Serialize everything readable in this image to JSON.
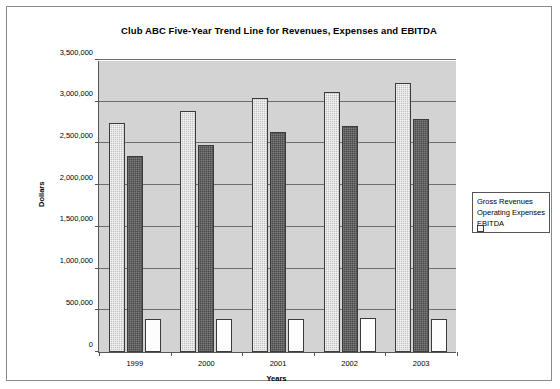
{
  "chart_data": {
    "type": "bar",
    "title": "Club ABC Five-Year Trend Line for Revenues, Expenses and EBITDA",
    "xlabel": "Years",
    "ylabel": "Dollars",
    "categories": [
      "1999",
      "2000",
      "2001",
      "2002",
      "2003"
    ],
    "ylim": [
      0,
      3500000
    ],
    "ytick_labels": [
      "0",
      "500,000",
      "1,000,000",
      "1,500,000",
      "2,000,000",
      "2,500,000",
      "3,000,000",
      "3,500,000"
    ],
    "ytick_values": [
      0,
      500000,
      1000000,
      1500000,
      2000000,
      2500000,
      3000000,
      3500000
    ],
    "grid": true,
    "legend_position": "right",
    "series": [
      {
        "name": "Gross Revenues",
        "color": "#c2c2c2",
        "values": [
          2740000,
          2890000,
          3050000,
          3120000,
          3220000
        ]
      },
      {
        "name": "Operating Expenses",
        "color": "#4a4a4a",
        "values": [
          2350000,
          2480000,
          2640000,
          2710000,
          2790000
        ]
      },
      {
        "name": "EBITDA",
        "color": "#fdfdfd",
        "values": [
          400000,
          390000,
          400000,
          405000,
          400000
        ]
      }
    ]
  }
}
